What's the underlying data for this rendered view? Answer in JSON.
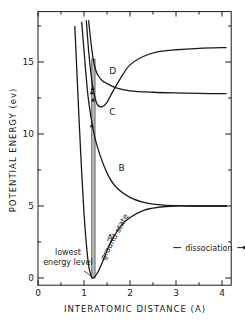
{
  "chart_data": {
    "type": "line",
    "title": "",
    "xlabel": "INTERATOMIC DISTANCE (A)",
    "ylabel": "POTENTIAL ENERGY (ev)",
    "xlim": [
      0,
      4.2
    ],
    "ylim": [
      -0.5,
      18.5
    ],
    "xticks": [
      0,
      1,
      2,
      3,
      4
    ],
    "yticks": [
      0,
      5,
      10,
      15
    ],
    "grid": false,
    "legend": "none",
    "series": [
      {
        "name": "A",
        "label": "ground state",
        "x": [
          0.8,
          0.85,
          0.9,
          0.95,
          1.0,
          1.05,
          1.1,
          1.15,
          1.2,
          1.3,
          1.4,
          1.5,
          1.6,
          1.8,
          2.0,
          2.3,
          2.6,
          3.0,
          3.3,
          4.1
        ],
        "y": [
          17.5,
          14.0,
          10.5,
          7.3,
          4.5,
          2.4,
          0.9,
          0.2,
          0.0,
          0.4,
          1.1,
          1.9,
          2.6,
          3.6,
          4.2,
          4.7,
          4.9,
          5.0,
          5.0,
          5.0
        ]
      },
      {
        "name": "B",
        "x": [
          0.95,
          1.0,
          1.05,
          1.1,
          1.2,
          1.3,
          1.5,
          1.7,
          2.0,
          2.3,
          2.6,
          3.0,
          3.5,
          4.1
        ],
        "y": [
          17.8,
          15.8,
          13.9,
          12.3,
          10.3,
          9.0,
          7.3,
          6.3,
          5.6,
          5.25,
          5.1,
          5.02,
          5.0,
          5.0
        ]
      },
      {
        "name": "C",
        "x": [
          1.05,
          1.1,
          1.15,
          1.2,
          1.25,
          1.3,
          1.4,
          1.5,
          1.6,
          1.8,
          2.0,
          2.3,
          2.6,
          3.0,
          3.5,
          4.1
        ],
        "y": [
          17.9,
          15.8,
          14.2,
          13.1,
          12.4,
          12.0,
          11.9,
          12.2,
          12.8,
          13.9,
          14.8,
          15.4,
          15.7,
          15.85,
          15.95,
          16.0
        ]
      },
      {
        "name": "D",
        "x": [
          1.1,
          1.15,
          1.2,
          1.25,
          1.3,
          1.4,
          1.5,
          1.7,
          2.0,
          2.5,
          3.0,
          3.5,
          4.1
        ],
        "y": [
          17.9,
          16.4,
          15.2,
          14.5,
          14.1,
          13.7,
          13.5,
          13.2,
          13.0,
          12.9,
          12.85,
          12.82,
          12.8
        ]
      }
    ],
    "annotations": [
      {
        "text": "D",
        "x": 1.55,
        "y": 14.2
      },
      {
        "text": "C",
        "x": 1.55,
        "y": 11.3
      },
      {
        "text": "B",
        "x": 1.75,
        "y": 7.4
      },
      {
        "text": "A",
        "x": 1.5,
        "y": 2.6
      },
      {
        "text": "ground state",
        "x": 1.45,
        "y": 1.2,
        "rotation": -62
      },
      {
        "text": "lowest",
        "x": 0.65,
        "y": 1.6
      },
      {
        "text": "energy level",
        "x": 0.65,
        "y": 0.9
      },
      {
        "text": "dissociation",
        "x": 3.2,
        "y": 1.9,
        "arrow": "both"
      }
    ],
    "vertical_transition_band": {
      "x": [
        1.17,
        1.24
      ],
      "y_range": [
        0,
        15.2
      ]
    }
  }
}
